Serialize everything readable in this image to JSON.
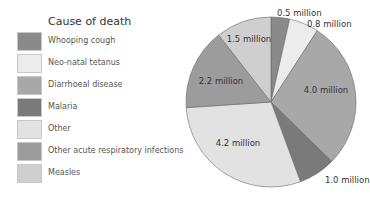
{
  "chart_data": {
    "type": "pie",
    "title": "",
    "legend_title": "Cause of death",
    "legend_position": "left",
    "unit": "million",
    "categories": [
      "Whooping cough",
      "Neo-natal tetanus",
      "Diarrhoeal disease",
      "Malaria",
      "Other",
      "Other acute respiratory infections",
      "Measles"
    ],
    "values": [
      0.5,
      0.8,
      4.0,
      1.0,
      4.2,
      2.2,
      1.5
    ],
    "labels": [
      "0.5 million",
      "0.8 million",
      "4.0 million",
      "1.0 million",
      "4.2 million",
      "2.2 million",
      "1.5 million"
    ],
    "colors": [
      "#8a8a8a",
      "#ececec",
      "#a8a8a8",
      "#7a7a7a",
      "#e2e2e2",
      "#9c9c9c",
      "#cfcfcf"
    ],
    "start_angle_deg": 0,
    "direction": "clockwise"
  },
  "legend": {
    "title": "Cause of death",
    "items": [
      {
        "label": "Whooping cough",
        "color": "#8a8a8a"
      },
      {
        "label": "Neo-natal tetanus",
        "color": "#ececec"
      },
      {
        "label": "Diarrhoeal disease",
        "color": "#a8a8a8"
      },
      {
        "label": "Malaria",
        "color": "#7a7a7a"
      },
      {
        "label": "Other",
        "color": "#e2e2e2"
      },
      {
        "label": "Other acute respiratory infections",
        "color": "#9c9c9c"
      },
      {
        "label": "Measles",
        "color": "#cfcfcf"
      }
    ]
  }
}
